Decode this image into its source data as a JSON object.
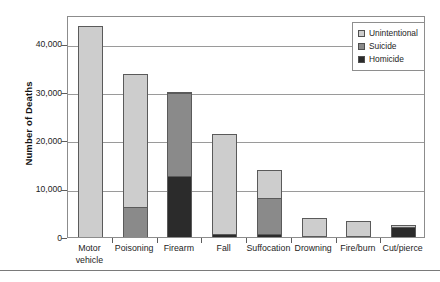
{
  "chart_data": {
    "type": "bar",
    "subtype": "stacked-bar",
    "title": "",
    "xlabel": "",
    "ylabel": "Number of Deaths",
    "ylim": [
      0,
      46000
    ],
    "ytick_values": [
      0,
      10000,
      20000,
      30000,
      40000
    ],
    "ytick_labels": [
      "0",
      "10,000",
      "20,000",
      "30,000",
      "40,000"
    ],
    "grid": true,
    "grid_axis": "y",
    "legend_position": "top-right",
    "categories": [
      "Motor vehicle",
      "Poisoning",
      "Firearm",
      "Fall",
      "Suffocation",
      "Drowning",
      "Fire/burn",
      "Cut/pierce"
    ],
    "category_label_lines": [
      [
        "Motor",
        "vehicle"
      ],
      [
        "Poisoning"
      ],
      [
        "Firearm"
      ],
      [
        "Fall"
      ],
      [
        "Suffocation"
      ],
      [
        "Drowning"
      ],
      [
        "Fire/burn"
      ],
      [
        "Cut/pierce"
      ]
    ],
    "series": [
      {
        "name": "Homicide",
        "color": "#2b2b2b",
        "values": [
          0,
          0,
          12600,
          700,
          700,
          120,
          120,
          2050
        ]
      },
      {
        "name": "Suicide",
        "color": "#8a8a8a",
        "values": [
          0,
          6200,
          17300,
          0,
          7300,
          0,
          0,
          0
        ]
      },
      {
        "name": "Unintentional",
        "color": "#cdcdcd",
        "values": [
          43700,
          27500,
          200,
          20700,
          5800,
          3780,
          3280,
          350
        ]
      }
    ],
    "totals": [
      43700,
      33700,
      30100,
      21400,
      13800,
      3900,
      3400,
      2400
    ]
  },
  "legend": {
    "items": [
      {
        "label": "Unintentional",
        "color": "#cdcdcd"
      },
      {
        "label": "Suicide",
        "color": "#8a8a8a"
      },
      {
        "label": "Homicide",
        "color": "#2b2b2b"
      }
    ]
  },
  "axes": {
    "y_title": "Number of Deaths"
  }
}
